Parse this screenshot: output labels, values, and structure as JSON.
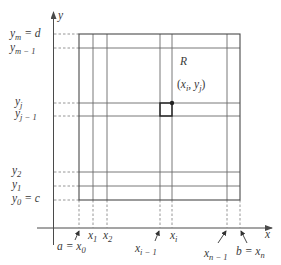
{
  "diagram": {
    "axes": {
      "x_label": "x",
      "y_label": "y"
    },
    "region_label": "R",
    "point_label": {
      "open": "(",
      "x_main": "x",
      "x_sub": "i",
      "sep": ", ",
      "y_main": "y",
      "y_sub": "j",
      "close": ")"
    },
    "y_ticks": [
      {
        "main": "y",
        "sub": "m",
        "rest": " = d"
      },
      {
        "main": "y",
        "sub": "m − 1",
        "rest": ""
      },
      {
        "main": "y",
        "sub": "j",
        "rest": ""
      },
      {
        "main": "y",
        "sub": "j − 1",
        "rest": ""
      },
      {
        "main": "y",
        "sub": "2",
        "rest": ""
      },
      {
        "main": "y",
        "sub": "1",
        "rest": ""
      },
      {
        "main": "y",
        "sub": "0",
        "rest": " = c"
      }
    ],
    "x_ticks": [
      {
        "pre": "a = ",
        "main": "x",
        "sub": "0"
      },
      {
        "pre": "",
        "main": "x",
        "sub": "1"
      },
      {
        "pre": "",
        "main": "x",
        "sub": "2"
      },
      {
        "pre": "",
        "main": "x",
        "sub": "i − 1"
      },
      {
        "pre": "",
        "main": "x",
        "sub": "i"
      },
      {
        "pre": "",
        "main": "x",
        "sub": "n − 1"
      },
      {
        "pre": "b = ",
        "main": "x",
        "sub": "n"
      }
    ],
    "colors": {
      "lines": "#4a4a4a",
      "dashed": "#8a8a8a",
      "highlight_cell": "#222222",
      "text": "#3a3a3a"
    }
  }
}
